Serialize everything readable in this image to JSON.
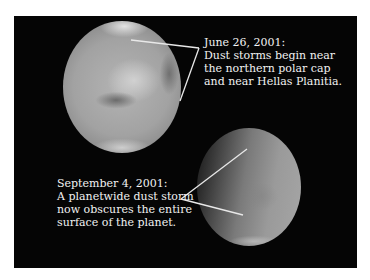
{
  "figure": {
    "background_color": "#ffffff",
    "panel_color": "#050505",
    "line_color": "#e8e8e8",
    "planets": [
      {
        "name": "mars-before-storm",
        "date": "June 26, 2001"
      },
      {
        "name": "mars-during-storm",
        "date": "September 4, 2001"
      }
    ],
    "captions": {
      "top": {
        "date": "June 26, 2001:",
        "lines": [
          "Dust storms begin near",
          "the northern polar cap",
          "and near Hellas Planitia."
        ]
      },
      "bottom": {
        "date": "September 4, 2001:",
        "lines": [
          "A planetwide dust storm",
          "now obscures the entire",
          "surface of the planet."
        ]
      }
    }
  }
}
